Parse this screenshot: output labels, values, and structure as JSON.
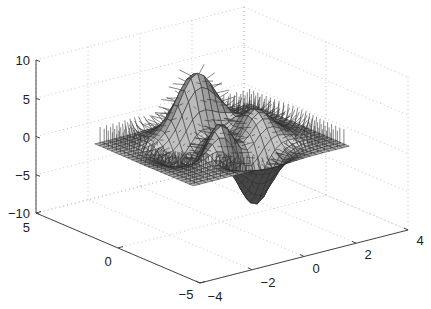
{
  "chart_data": {
    "type": "surface",
    "function": "peaks",
    "title": "",
    "xlabel": "",
    "ylabel": "",
    "zlabel": "",
    "x_ticks": [
      -4,
      -2,
      0,
      2,
      4
    ],
    "x_tick_labels": [
      "−4",
      "−2",
      "0",
      "2",
      "4"
    ],
    "y_ticks": [
      -5,
      0,
      5
    ],
    "y_tick_labels": [
      "−5",
      "0",
      "5"
    ],
    "z_ticks": [
      -10,
      -5,
      0,
      5,
      10
    ],
    "z_tick_labels": [
      "−10",
      "−5",
      "0",
      "5",
      "10"
    ],
    "xlim": [
      -4,
      4
    ],
    "ylim": [
      -5,
      5
    ],
    "zlim": [
      -10,
      10
    ],
    "grid": true,
    "grid_resolution": 25,
    "shows_surface_normals": true,
    "colormap": "gray",
    "peak_max_approx": 8.1,
    "peak_min_approx": -6.5,
    "legend": null
  },
  "colors": {
    "axis": "#444444",
    "grid": "#b8b8b8",
    "mesh_edge": "#2a2a2a",
    "normal_arrow": "#333333"
  }
}
